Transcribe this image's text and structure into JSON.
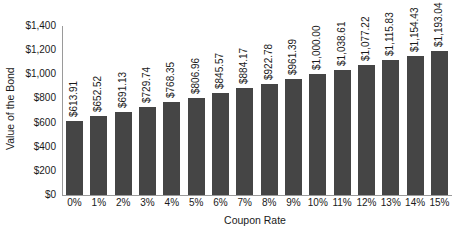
{
  "chart_data": {
    "type": "bar",
    "title": "",
    "xlabel": "Coupon Rate",
    "ylabel": "Value of the Bond",
    "categories": [
      "0%",
      "1%",
      "2%",
      "3%",
      "4%",
      "5%",
      "6%",
      "7%",
      "8%",
      "9%",
      "10%",
      "11%",
      "12%",
      "13%",
      "14%",
      "15%"
    ],
    "values": [
      613.91,
      652.52,
      691.13,
      729.74,
      768.35,
      806.96,
      845.57,
      884.17,
      922.78,
      961.39,
      1000.0,
      1038.61,
      1077.22,
      1115.83,
      1154.43,
      1193.04
    ],
    "data_labels": [
      "$613.91",
      "$652.52",
      "$691.13",
      "$729.74",
      "$768.35",
      "$806.96",
      "$845.57",
      "$884.17",
      "$922.78",
      "$961.39",
      "$1,000.00",
      "$1,038.61",
      "$1,077.22",
      "$1,115.83",
      "$1,154.43",
      "$1,193.04"
    ],
    "ylim": [
      0,
      1400
    ],
    "yticks": [
      0,
      200,
      400,
      600,
      800,
      1000,
      1200,
      1400
    ],
    "ytick_labels": [
      "$0",
      "$200",
      "$400",
      "$600",
      "$800",
      "$1,000",
      "$1,200",
      "$1,400"
    ],
    "grid": false,
    "legend": null,
    "bar_color": "#454545"
  }
}
